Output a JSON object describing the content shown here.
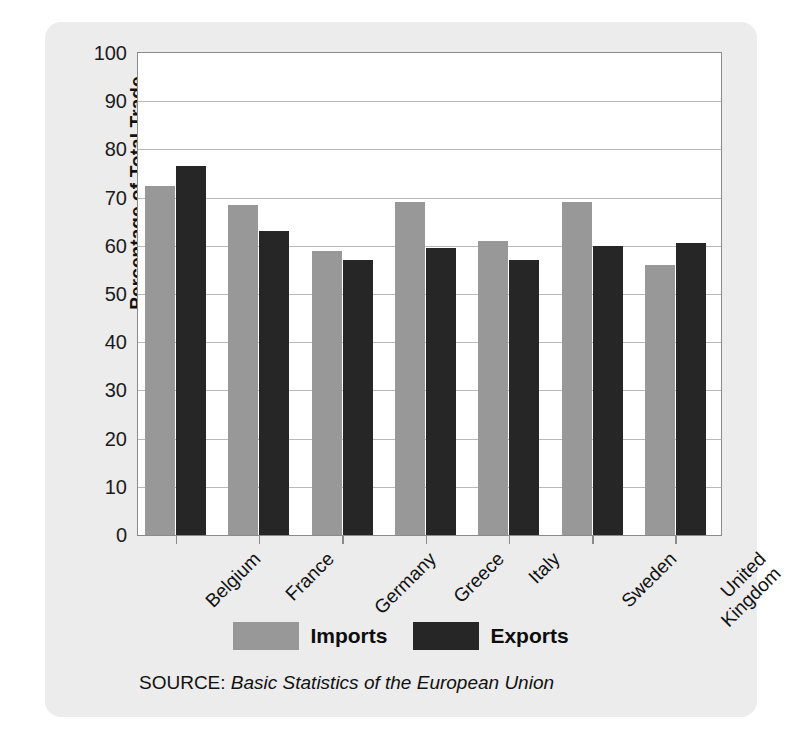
{
  "chart_data": {
    "type": "bar",
    "title": "",
    "xlabel": "",
    "ylabel": "Percentage of Total Trade",
    "ylim": [
      0,
      100
    ],
    "ytick_step": 10,
    "yticks": [
      100,
      90,
      80,
      70,
      60,
      50,
      40,
      30,
      20,
      10,
      0
    ],
    "grid": true,
    "legend_position": "bottom-center",
    "categories": [
      "Belgium",
      "France",
      "Germany",
      "Greece",
      "Italy",
      "Sweden",
      "United Kingdom"
    ],
    "category_lines": [
      [
        "Belgium"
      ],
      [
        "France"
      ],
      [
        "Germany"
      ],
      [
        "Greece"
      ],
      [
        "Italy"
      ],
      [
        "Sweden"
      ],
      [
        "United",
        "Kingdom"
      ]
    ],
    "series": [
      {
        "name": "Imports",
        "color": "#989898",
        "values": [
          72.5,
          68.5,
          59,
          69,
          61,
          69,
          56
        ]
      },
      {
        "name": "Exports",
        "color": "#262626",
        "values": [
          76.5,
          63,
          57,
          59.5,
          57,
          60,
          60.5
        ]
      }
    ],
    "source_prefix": "SOURCE:",
    "source_title": "Basic Statistics of the European Union"
  },
  "figure": {
    "background": "#ececed",
    "plot_background": "#ffffff",
    "frame_color": "#8a8a8a",
    "gridline_color": "#b9b9b9"
  }
}
